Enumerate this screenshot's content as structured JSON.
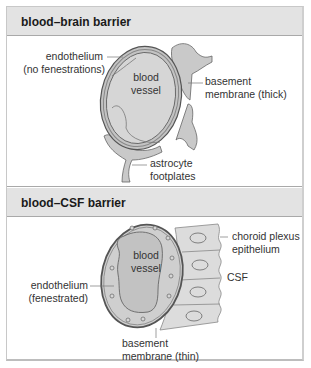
{
  "panels": [
    {
      "title": "blood–brain barrier",
      "labels": {
        "endothelium_line1": "endothelium",
        "endothelium_line2": "(no fenestrations)",
        "vessel_line1": "blood",
        "vessel_line2": "vessel",
        "basement_line1": "basement",
        "basement_line2": "membrane  (thick)",
        "astrocyte_line1": "astrocyte",
        "astrocyte_line2": "footplates"
      }
    },
    {
      "title": "blood–CSF barrier",
      "labels": {
        "choroid_line1": "choroid plexus",
        "choroid_line2": "epithelium",
        "vessel_line1": "blood",
        "vessel_line2": "vessel",
        "csf": "CSF",
        "endothelium_line1": "endothelium",
        "endothelium_line2": "(fenestrated)",
        "basement_line1": "basement",
        "basement_line2": "membrane (thin)"
      }
    }
  ],
  "colors": {
    "header_bg": "#e3e3e3",
    "tissue_fill": "#c9c9c9",
    "lumen_fill": "#d6d6d6",
    "outline": "#555555",
    "epithelium_fill": "#dcdcdc"
  }
}
